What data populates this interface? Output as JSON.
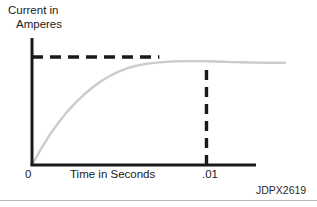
{
  "figure": {
    "code": "JDPX2619",
    "background_color": "#ffffff",
    "rule_color": "#b9b9b9"
  },
  "chart_data": {
    "type": "line",
    "title": "",
    "subtitle": "",
    "ylabel_line1": "Current in",
    "ylabel_line2": "Amperes",
    "ylabel": "Current in Amperes",
    "xlabel": "Time in Seconds",
    "x_tick_labels": [
      "0",
      ".01"
    ],
    "x_tick_values": [
      0,
      0.01
    ],
    "y_tick_labels": [],
    "grid": false,
    "legend": null,
    "axis_color": "#1a1a1a",
    "curve_color": "#cccccc",
    "dash_color": "#1a1a1a",
    "xlim": [
      0,
      0.0145
    ],
    "ylim": [
      0,
      1.12
    ],
    "annotations": [
      {
        "name": "steady-state-asymptote",
        "type": "horizontal-dashed-line",
        "y": 1.0,
        "x_start": 0,
        "x_end": 0.0073
      },
      {
        "name": "time-marker-point01",
        "type": "vertical-dashed-line",
        "x": 0.01,
        "y_start": 0,
        "y_end": 0.945
      }
    ],
    "series": [
      {
        "name": "inductor-current-rise",
        "description": "Exponential rise of current toward steady state",
        "x": [
          0,
          0.0005,
          0.001,
          0.0015,
          0.002,
          0.0025,
          0.003,
          0.0035,
          0.004,
          0.0045,
          0.005,
          0.0055,
          0.006,
          0.0065,
          0.007,
          0.0075,
          0.008,
          0.0085,
          0.009,
          0.0095,
          0.01,
          0.0105,
          0.011,
          0.0115,
          0.012,
          0.0125,
          0.013,
          0.0135,
          0.014,
          0.0145
        ],
        "y": [
          0.0,
          0.145,
          0.275,
          0.39,
          0.49,
          0.578,
          0.655,
          0.722,
          0.78,
          0.828,
          0.868,
          0.898,
          0.92,
          0.935,
          0.946,
          0.953,
          0.958,
          0.961,
          0.962,
          0.962,
          0.961,
          0.959,
          0.956,
          0.953,
          0.951,
          0.949,
          0.948,
          0.947,
          0.947,
          0.947
        ]
      }
    ]
  }
}
